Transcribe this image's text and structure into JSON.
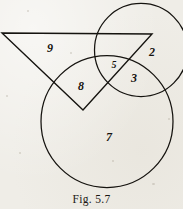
{
  "figure": {
    "caption": "Fig. 5.7",
    "stroke_color": "#15130f",
    "background_color": "#efede7",
    "shapes": [
      {
        "name": "small-circle",
        "type": "circle",
        "cx": 141,
        "cy": 50,
        "r": 46.5
      },
      {
        "name": "large-circle",
        "type": "circle",
        "cx": 107,
        "cy": 121.5,
        "r": 66
      },
      {
        "name": "triangle",
        "type": "polygon",
        "points": "2,33 152,34 83,110"
      }
    ],
    "region_labels": [
      {
        "name": "region-label-9",
        "text": "9",
        "x": 50,
        "y": 48,
        "size": "normal"
      },
      {
        "name": "region-label-2",
        "text": "2",
        "x": 152,
        "y": 52,
        "size": "normal"
      },
      {
        "name": "region-label-5",
        "text": "5",
        "x": 114,
        "y": 65,
        "size": "small"
      },
      {
        "name": "region-label-3",
        "text": "3",
        "x": 134,
        "y": 78,
        "size": "normal"
      },
      {
        "name": "region-label-8",
        "text": "8",
        "x": 81,
        "y": 86,
        "size": "normal"
      },
      {
        "name": "region-label-7",
        "text": "7",
        "x": 109,
        "y": 137,
        "size": "normal"
      }
    ]
  }
}
